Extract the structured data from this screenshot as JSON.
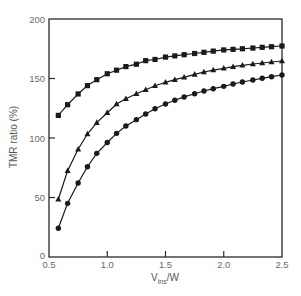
{
  "chart_data": {
    "type": "line",
    "title": "",
    "xlabel": "V_ins/W",
    "xlabel_main": "V",
    "xlabel_sub": "ins",
    "xlabel_tail": "/W",
    "ylabel": "TMR ratio (%)",
    "xlim": [
      0.5,
      2.5
    ],
    "ylim": [
      0,
      200
    ],
    "grid": false,
    "legend": "none",
    "x_ticks": [
      0.5,
      1.0,
      1.5,
      2.0,
      2.5
    ],
    "x_tick_labels": [
      "0.5",
      "1.0",
      "1.5",
      "2.0",
      "2.5"
    ],
    "y_ticks": [
      0,
      50,
      100,
      150,
      200
    ],
    "y_tick_labels": [
      "0",
      "50",
      "100",
      "150",
      "200"
    ],
    "x": [
      0.58,
      0.66,
      0.75,
      0.83,
      0.91,
      1.0,
      1.08,
      1.16,
      1.25,
      1.33,
      1.41,
      1.5,
      1.58,
      1.66,
      1.75,
      1.83,
      1.91,
      2.0,
      2.08,
      2.16,
      2.25,
      2.33,
      2.41,
      2.5
    ],
    "series": [
      {
        "name": "squares",
        "marker": "square",
        "values": [
          119,
          128,
          137,
          144,
          149,
          154,
          157,
          160,
          162,
          165,
          166,
          168,
          169,
          170,
          171,
          172,
          173,
          174,
          174.5,
          175,
          175.6,
          176.2,
          176.7,
          177.3
        ]
      },
      {
        "name": "triangles",
        "marker": "triangle",
        "values": [
          48.5,
          72.5,
          90.5,
          103.4,
          112.9,
          121.3,
          128.6,
          133.0,
          137.2,
          140.6,
          143.9,
          146.8,
          149.0,
          151.0,
          153.5,
          155.5,
          157.1,
          158.6,
          159.9,
          161.1,
          162.2,
          163.0,
          163.9,
          164.7
        ]
      },
      {
        "name": "circles",
        "marker": "circle",
        "values": [
          24.1,
          45.1,
          62.2,
          75.9,
          87.1,
          96.2,
          103.9,
          110.1,
          115.4,
          120.2,
          124.6,
          128.6,
          131.7,
          134.5,
          137.2,
          139.5,
          141.4,
          143.4,
          145.4,
          147.1,
          148.7,
          150.2,
          151.5,
          152.9
        ]
      }
    ],
    "colors": {
      "line": "#1a1a1a",
      "axis": "#2a2a2a",
      "tick_text": "#6a6a6a"
    }
  }
}
